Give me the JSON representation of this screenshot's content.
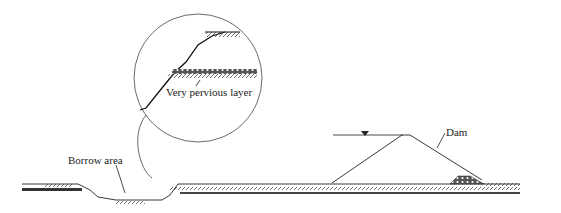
{
  "diagram": {
    "labels": {
      "pervious_layer": "Very pervious layer",
      "borrow_area": "Borrow area",
      "dam": "Dam"
    },
    "symbols": {
      "water_level": "water-level-triangle"
    },
    "colors": {
      "line": "#222222",
      "background": "#ffffff"
    }
  }
}
